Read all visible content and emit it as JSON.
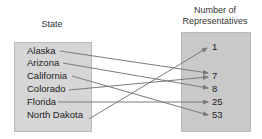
{
  "headers": {
    "domain": "State",
    "range_line1": "Number of",
    "range_line2": "Representatives"
  },
  "domain_items": [
    "Alaska",
    "Arizona",
    "California",
    "Colorado",
    "Florida",
    "North Dakota"
  ],
  "range_items": [
    "1",
    "7",
    "8",
    "25",
    "53"
  ],
  "mapping": [
    {
      "from": "Alaska",
      "to": "7"
    },
    {
      "from": "Arizona",
      "to": "8"
    },
    {
      "from": "California",
      "to": "53"
    },
    {
      "from": "Colorado",
      "to": "7"
    },
    {
      "from": "Florida",
      "to": "25"
    },
    {
      "from": "North Dakota",
      "to": "1"
    }
  ],
  "colors": {
    "arrow": "#7a7a7a",
    "left_box": "#d6d6d6",
    "right_box": "#c9c9c9"
  }
}
